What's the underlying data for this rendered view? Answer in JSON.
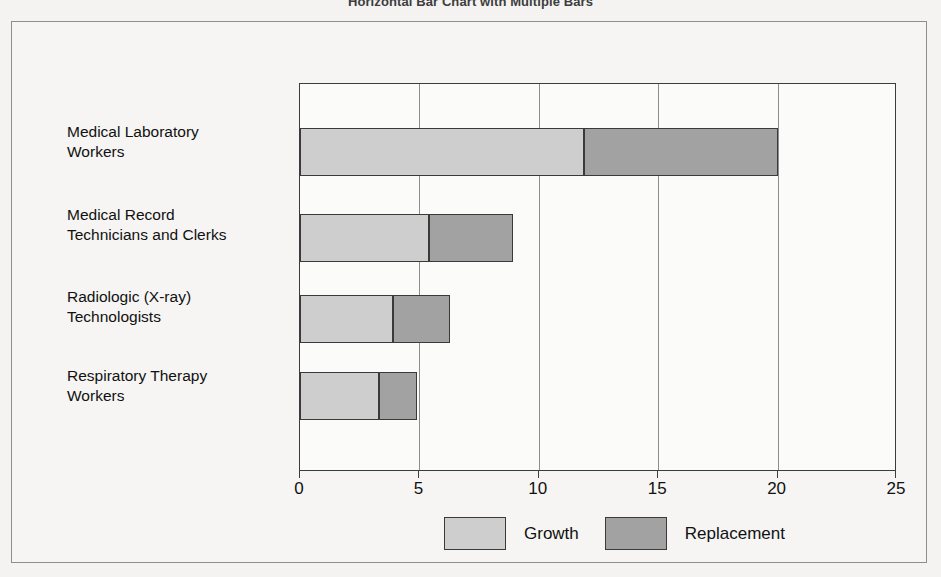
{
  "chart_data": {
    "type": "bar",
    "orientation": "horizontal",
    "stacked": true,
    "title": "Horizontal Bar Chart with Multiple Bars",
    "xlabel": "",
    "ylabel": "",
    "xlim": [
      0,
      25
    ],
    "xticks": [
      0,
      5,
      10,
      15,
      20,
      25
    ],
    "xtick_labels": [
      "0",
      "5",
      "10",
      "15",
      "20",
      "25"
    ],
    "grid": true,
    "grid_axis": "x",
    "legend_position": "bottom",
    "categories": [
      "Medical Laboratory Workers",
      "Medical Record Technicians and Clerks",
      "Radiologic (X-ray) Technologists",
      "Respiratory Therapy Workers"
    ],
    "category_lines": [
      [
        "Medical Laboratory",
        "Workers"
      ],
      [
        "Medical Record",
        "Technicians and Clerks"
      ],
      [
        "Radiologic (X-ray)",
        "Technologists"
      ],
      [
        "Respiratory Therapy",
        "Workers"
      ]
    ],
    "series": [
      {
        "name": "Growth",
        "color": "#cecece",
        "values": [
          11.9,
          5.4,
          3.9,
          3.3
        ]
      },
      {
        "name": "Replacement",
        "color": "#a2a2a2",
        "values": [
          8.1,
          3.5,
          2.4,
          1.6
        ]
      }
    ],
    "totals": [
      20.0,
      8.9,
      6.3,
      4.9
    ]
  },
  "legend": {
    "items": [
      {
        "label": "Growth",
        "swatch": "growth"
      },
      {
        "label": "Replacement",
        "swatch": "replacement"
      }
    ]
  },
  "colors": {
    "growth": "#cecece",
    "replacement": "#a2a2a2",
    "axis": "#3c3c3c",
    "grid": "#8d8d8d",
    "frame": "#8e8e8e",
    "page_background": "#f4f3f1"
  }
}
